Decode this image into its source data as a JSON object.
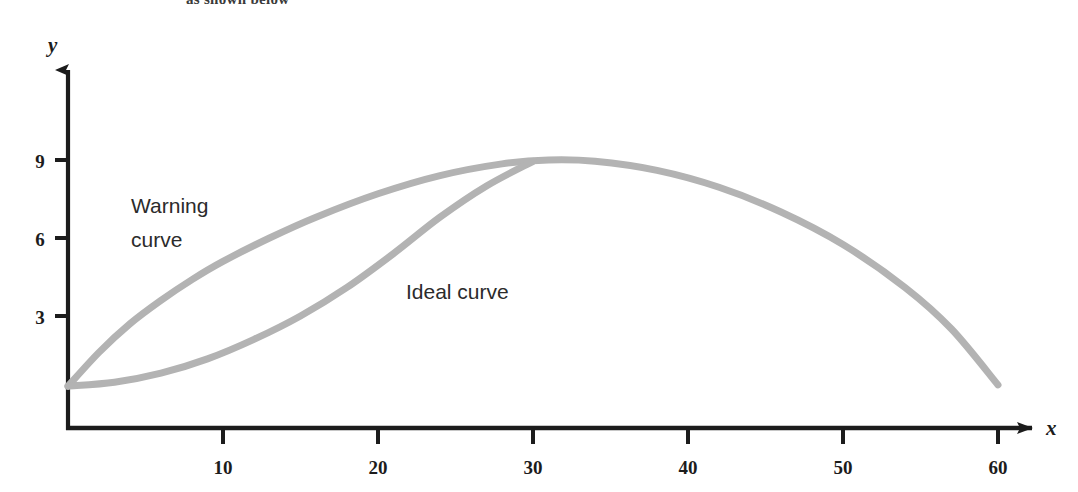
{
  "page": {
    "top_partial_text": "as shown below"
  },
  "chart_data": {
    "type": "line",
    "title": "",
    "xlabel": "x",
    "ylabel": "y",
    "xlim": [
      0,
      63
    ],
    "ylim": [
      0,
      12.5
    ],
    "xticks": [
      10,
      20,
      30,
      40,
      50,
      60
    ],
    "yticks": [
      3,
      6,
      9
    ],
    "xtick_labels": [
      "10",
      "20",
      "30",
      "40",
      "50",
      "60"
    ],
    "ytick_labels": [
      "3",
      "6",
      "9"
    ],
    "grid": false,
    "legend": "inline-annotations",
    "curve_color": "#b3b3b3",
    "axis_color": "#1c1c1c",
    "series": [
      {
        "name": "Warning curve",
        "label_lines": [
          "Warning",
          "curve"
        ],
        "x": [
          0,
          2,
          4,
          6,
          8,
          10,
          13,
          16,
          20,
          24,
          28,
          31,
          34,
          38,
          42,
          46,
          50,
          54,
          57,
          60
        ],
        "y": [
          0.3,
          1.6,
          2.7,
          3.6,
          4.4,
          5.1,
          6.0,
          6.8,
          7.7,
          8.4,
          8.85,
          9.0,
          8.95,
          8.6,
          7.95,
          7.0,
          5.75,
          4.1,
          2.5,
          0.35
        ]
      },
      {
        "name": "Ideal curve",
        "label_lines": [
          "Ideal curve"
        ],
        "x": [
          0,
          3,
          6,
          9,
          12,
          15,
          18,
          21,
          24,
          27,
          30
        ],
        "y": [
          0.3,
          0.45,
          0.8,
          1.35,
          2.1,
          3.0,
          4.1,
          5.4,
          6.8,
          8.0,
          8.95
        ]
      }
    ],
    "annotations": [
      {
        "text": "Warning curve",
        "x": 6,
        "y": 7.2
      },
      {
        "text": "Ideal curve",
        "x": 24.5,
        "y": 4.6
      }
    ],
    "intersection_point": {
      "x": 30,
      "y": 9.0
    }
  }
}
